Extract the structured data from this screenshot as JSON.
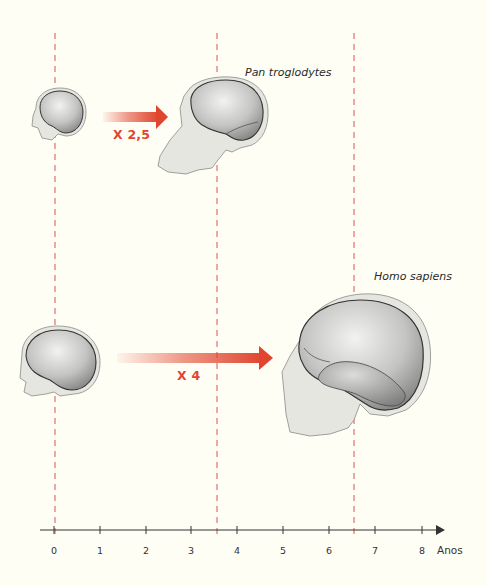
{
  "figure": {
    "type": "diagram",
    "colors": {
      "background": "#fffef5",
      "accent_red": "#e0462f",
      "dashed_line": "#d9534f",
      "axis": "#333333",
      "skull_fill": "#e4e4df",
      "brain_fill": "#a9a9a9"
    }
  },
  "labels": {
    "pan": "Pan troglodytes",
    "homo": "Homo sapiens",
    "factor_pan": "X 2,5",
    "factor_homo": "X 4"
  },
  "axis": {
    "unit": "Anos",
    "ticks": [
      "0",
      "1",
      "2",
      "3",
      "4",
      "5",
      "6",
      "7",
      "8"
    ],
    "markers_years": [
      0,
      3.5,
      6.5
    ]
  },
  "rows": [
    {
      "species": "Pan troglodytes",
      "growth_factor": "X 2,5",
      "start_year": 0,
      "end_year": 3.5
    },
    {
      "species": "Homo sapiens",
      "growth_factor": "X 4",
      "start_year": 0,
      "end_year": 6.5
    }
  ]
}
